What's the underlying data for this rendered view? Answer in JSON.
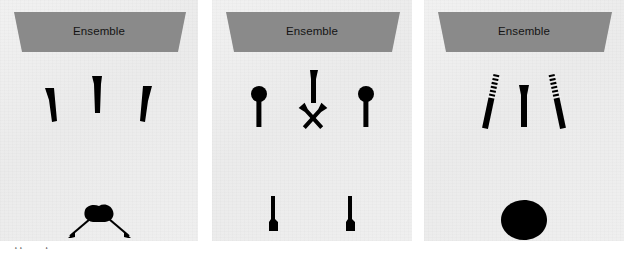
{
  "figure": {
    "width": 624,
    "height": 259,
    "background_color": "#ffffff",
    "panel_background_color": "#eeeeee",
    "banner_color": "#8a8a8a",
    "glyph_color": "#000000"
  },
  "panels": [
    {
      "id": "panel-1",
      "banner_label": "Ensemble",
      "glyphs": [
        {
          "name": "tapered-marker-left",
          "shape": "tapered-bar",
          "tilt": "right"
        },
        {
          "name": "tapered-marker-center",
          "shape": "tapered-bar",
          "tilt": "none"
        },
        {
          "name": "tapered-marker-right",
          "shape": "tapered-bar",
          "tilt": "left"
        },
        {
          "name": "blob-with-diverging-arrows",
          "shape": "blob-arrows",
          "arrows": 2
        }
      ]
    },
    {
      "id": "panel-2",
      "banner_label": "Ensemble",
      "glyphs": [
        {
          "name": "pin-marker-left",
          "shape": "round-head-pin",
          "tilt": "none"
        },
        {
          "name": "tapered-marker-top-center",
          "shape": "tapered-bar",
          "tilt": "none"
        },
        {
          "name": "pin-marker-right",
          "shape": "round-head-pin",
          "tilt": "none"
        },
        {
          "name": "cross-marker-center",
          "shape": "x-cross"
        },
        {
          "name": "inverted-marker-bottom-left",
          "shape": "inverted-tapered-bar"
        },
        {
          "name": "inverted-marker-bottom-right",
          "shape": "inverted-tapered-bar"
        }
      ]
    },
    {
      "id": "panel-3",
      "banner_label": "Ensemble",
      "glyphs": [
        {
          "name": "threaded-marker-left",
          "shape": "threaded-bar",
          "tilt": "right"
        },
        {
          "name": "tapered-marker-center",
          "shape": "tapered-bar",
          "tilt": "none"
        },
        {
          "name": "threaded-marker-right",
          "shape": "threaded-bar",
          "tilt": "left"
        },
        {
          "name": "filled-circle-bottom",
          "shape": "filled-circle"
        }
      ]
    }
  ],
  "caption": {
    "text": "cropped caption line"
  }
}
